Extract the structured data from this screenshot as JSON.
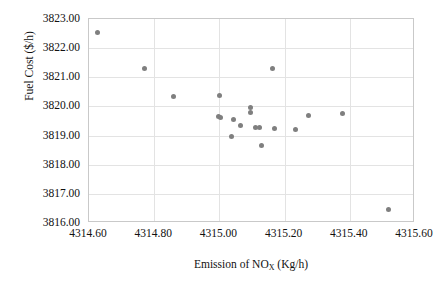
{
  "chart_data": {
    "type": "scatter",
    "title": "",
    "xlabel": "Emission of NOx (Kg/h)",
    "xlabel_parts": {
      "pre": "Emission of NO",
      "sub": "X",
      "post": " (Kg/h)"
    },
    "ylabel": "Fuel Cost ($/h)",
    "xlim": [
      4314.6,
      4315.6
    ],
    "ylim": [
      3816.0,
      3823.0
    ],
    "xticks": [
      4314.6,
      4314.8,
      4315.0,
      4315.2,
      4315.4,
      4315.6
    ],
    "yticks": [
      3816.0,
      3817.0,
      3818.0,
      3819.0,
      3820.0,
      3821.0,
      3822.0,
      3823.0
    ],
    "xtick_labels": [
      "4314.60",
      "4314.80",
      "4315.00",
      "4315.20",
      "4315.40",
      "4315.60"
    ],
    "ytick_labels": [
      "3816.00",
      "3817.00",
      "3818.00",
      "3819.00",
      "3820.00",
      "3821.00",
      "3822.00",
      "3823.00"
    ],
    "grid": true,
    "legend": false,
    "marker_color": "#7f7f7f",
    "marker_size": 5,
    "points": [
      {
        "x": 4314.625,
        "y": 3822.52
      },
      {
        "x": 4314.769,
        "y": 3821.3
      },
      {
        "x": 4314.858,
        "y": 3820.34
      },
      {
        "x": 4315.0,
        "y": 3820.38
      },
      {
        "x": 4314.997,
        "y": 3819.66
      },
      {
        "x": 4315.003,
        "y": 3819.62
      },
      {
        "x": 4315.043,
        "y": 3819.56
      },
      {
        "x": 4315.037,
        "y": 3818.97
      },
      {
        "x": 4315.064,
        "y": 3819.34
      },
      {
        "x": 4315.095,
        "y": 3819.98
      },
      {
        "x": 4315.095,
        "y": 3819.8
      },
      {
        "x": 4315.11,
        "y": 3819.27
      },
      {
        "x": 4315.122,
        "y": 3819.27
      },
      {
        "x": 4315.129,
        "y": 3818.66
      },
      {
        "x": 4315.163,
        "y": 3821.3
      },
      {
        "x": 4315.169,
        "y": 3819.24
      },
      {
        "x": 4315.233,
        "y": 3819.22
      },
      {
        "x": 4315.272,
        "y": 3819.68
      },
      {
        "x": 4315.379,
        "y": 3819.75
      },
      {
        "x": 4315.518,
        "y": 3816.45
      }
    ]
  }
}
